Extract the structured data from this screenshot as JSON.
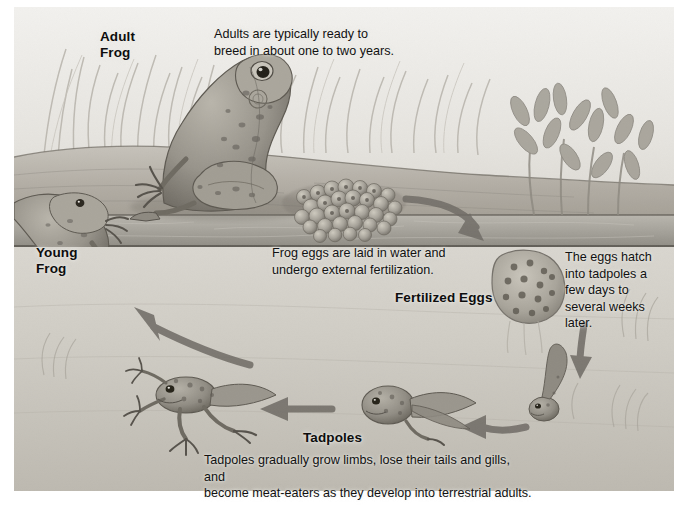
{
  "diagram": {
    "type": "illustrated-life-cycle-diagram",
    "palette": {
      "plate_background": "#d8d6d0",
      "page_background": "#ffffff",
      "water_band": "#a9a7a0",
      "lower_ground": "#cdcac3",
      "text": "#111111",
      "arrow": "#6e6a64"
    },
    "stages": [
      {
        "id": "adult-frog",
        "label": "Adult\nFrog",
        "caption": "Adults are typically ready to\nbreed in about one to two years."
      },
      {
        "id": "young-frog",
        "label": "Young\nFrog",
        "caption": ""
      },
      {
        "id": "fertilized-eggs",
        "label": "Fertilized Eggs",
        "caption": "Frog eggs are laid in water and\nundergo external fertilization."
      },
      {
        "id": "hatching",
        "label": "",
        "caption": "The eggs hatch\ninto tadpoles a\nfew days to\nseveral weeks\nlater."
      },
      {
        "id": "tadpoles",
        "label": "Tadpoles",
        "caption": "Tadpoles gradually grow limbs, lose their tails and gills, and\nbecome meat-eaters as they develop into terrestrial adults."
      }
    ],
    "labels": {
      "adult_frog": "Adult\nFrog",
      "young_frog": "Young\nFrog",
      "fertilized_eggs": "Fertilized Eggs",
      "tadpoles": "Tadpoles"
    },
    "captions": {
      "adult": "Adults are typically ready to\nbreed in about one to two years.",
      "eggs": "Frog eggs are laid in water and\nundergo external fertilization.",
      "hatch": "The eggs hatch\ninto tadpoles a\nfew days to\nseveral weeks\nlater.",
      "tadpoles": "Tadpoles gradually grow limbs, lose their tails and gills, and\nbecome meat-eaters as they develop into terrestrial adults."
    },
    "arrows": [
      {
        "id": "arrow-eggs-to-water",
        "direction": "down-right",
        "from": "fertilized-eggs-mass",
        "to": "water"
      },
      {
        "id": "arrow-hatch-down",
        "direction": "down",
        "from": "egg-cluster",
        "to": "hatchling-tadpole"
      },
      {
        "id": "arrow-hatchling-to-tadpole",
        "direction": "left",
        "from": "hatchling-tadpole",
        "to": "tadpole"
      },
      {
        "id": "arrow-tadpole-to-legged",
        "direction": "left",
        "from": "tadpole",
        "to": "legged-tadpole"
      },
      {
        "id": "arrow-legged-to-young-frog",
        "direction": "up-left",
        "from": "legged-tadpole",
        "to": "young-frog"
      }
    ]
  }
}
